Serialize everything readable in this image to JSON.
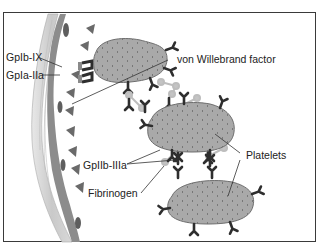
{
  "diagram": {
    "type": "biological-illustration",
    "labels": {
      "gpib_ix": "GpIb-IX",
      "gpia_iia": "GpIa-IIa",
      "vwf": "von Willebrand factor",
      "gpiib_iiia": "GpIIb-IIIa",
      "fibrinogen": "Fibrinogen",
      "platelets": "Platelets"
    },
    "colors": {
      "platelet_fill": "#a8a8a8",
      "platelet_stroke": "#6e6e6e",
      "receptor": "#2e2e2e",
      "fibrinogen": "#c4c4c4",
      "vwf_triangle": "#6a6a6a",
      "vessel_wall": "#b5b5b5",
      "endothelium": "#8a8a8a",
      "frame": "#3a3a3a"
    }
  }
}
